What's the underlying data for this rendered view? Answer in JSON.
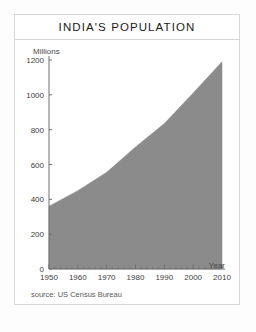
{
  "card": {
    "title": "INDIA'S POPULATION",
    "source_note": "source: US Census Bureau",
    "axis_unit_label": "Millions",
    "x_axis_title": "Year"
  },
  "chart_data": {
    "type": "area",
    "title": "INDIA'S POPULATION",
    "xlabel": "Year",
    "ylabel": "Millions",
    "x": [
      1950,
      1960,
      1970,
      1980,
      1990,
      2000,
      2010
    ],
    "values": [
      360,
      450,
      555,
      700,
      835,
      1010,
      1190
    ],
    "series": [
      {
        "name": "India population (millions)",
        "values": [
          360,
          450,
          555,
          700,
          835,
          1010,
          1190
        ]
      }
    ],
    "xlim": [
      1950,
      2010
    ],
    "ylim": [
      0,
      1200
    ],
    "xticks": [
      1950,
      1960,
      1970,
      1980,
      1990,
      2000,
      2010
    ],
    "xtick_labels": [
      "1950",
      "1960",
      "1970",
      "1980",
      "1990",
      "2000",
      "2010"
    ],
    "yticks": [
      0,
      200,
      400,
      600,
      800,
      1000,
      1200
    ],
    "ytick_labels": [
      "0",
      "200",
      "400",
      "600",
      "800",
      "1000",
      "1200"
    ],
    "minor_xtick_interval": 2,
    "grid": false,
    "legend": false,
    "annotation": "source: US Census Bureau",
    "colors": {
      "area_fill": "#8b8b8b",
      "axis": "#6e6e6e",
      "text": "#333333",
      "card_border": "#d7d7d7",
      "background": "#ffffff"
    }
  }
}
